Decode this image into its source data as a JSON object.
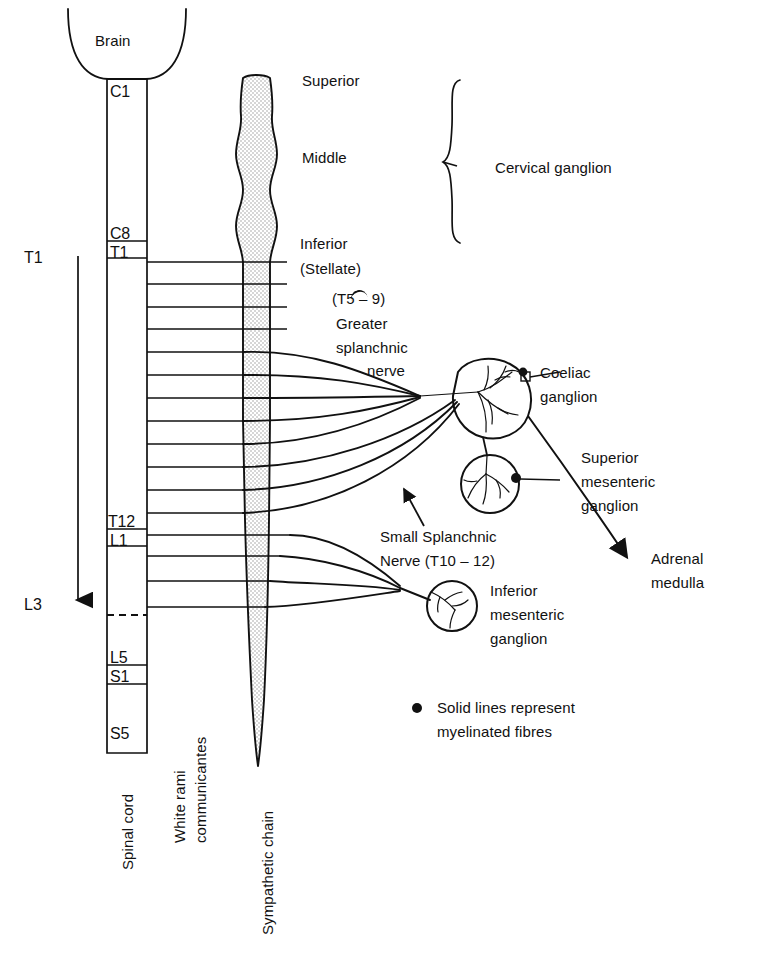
{
  "figure": {
    "ink_color": "#111111",
    "chain_fill": "#e8e8e8"
  },
  "brain": {
    "label": "Brain"
  },
  "spinal_cord": {
    "axis_label": "Spinal cord",
    "segments": [
      {
        "label": "C1"
      },
      {
        "label": "C8"
      },
      {
        "label": "T1"
      },
      {
        "label": "T12"
      },
      {
        "label": "L1"
      },
      {
        "label": "L5"
      },
      {
        "label": "S1"
      },
      {
        "label": "S5"
      }
    ]
  },
  "outflow_arrow": {
    "top_label": "T1",
    "bottom_label": "L3"
  },
  "rami": {
    "axis_label_line1": "White rami",
    "axis_label_line2": "communicantes"
  },
  "sympathetic_chain": {
    "axis_label": "Sympathetic chain",
    "ganglia": [
      {
        "label": "Superior"
      },
      {
        "label": "Middle"
      },
      {
        "label": "Inferior"
      },
      {
        "label": "(Stellate)"
      }
    ]
  },
  "cervical_brace": {
    "label": "Cervical ganglion"
  },
  "splanchnic": {
    "greater": {
      "levels": "(T5 – 9)",
      "line1": "Greater",
      "line2": "splanchnic",
      "line3": "nerve"
    },
    "small": {
      "line1": "Small Splanchnic",
      "line2": "Nerve (T10 – 12)"
    }
  },
  "ganglia_labels": {
    "coeliac_line1": "Coeliac",
    "coeliac_line2": "ganglion",
    "superior_mesenteric_line1": "Superior",
    "superior_mesenteric_line2": "mesenteric",
    "superior_mesenteric_line3": "ganglion",
    "inferior_mesenteric_line1": "Inferior",
    "inferior_mesenteric_line2": "mesenteric",
    "inferior_mesenteric_line3": "ganglion",
    "adrenal_line1": "Adrenal",
    "adrenal_line2": "medulla"
  },
  "legend": {
    "bullet": "●",
    "line1": "Solid lines represent",
    "line2": "myelinated fibres"
  }
}
